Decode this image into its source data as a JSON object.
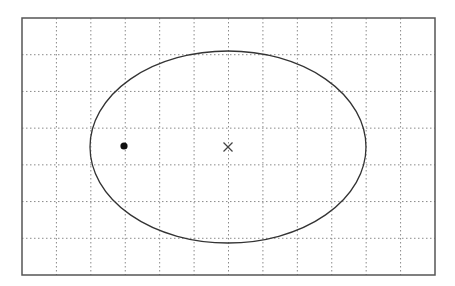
{
  "diagram": {
    "type": "ellipse-on-grid",
    "canvas": {
      "width": 455,
      "height": 286,
      "background": "#ffffff"
    },
    "frame": {
      "x": 22,
      "y": 18,
      "width": 413,
      "height": 257,
      "stroke": "#555555",
      "stroke_width": 1.5
    },
    "grid": {
      "columns": 12,
      "rows": 7,
      "stroke": "#8a8a8a",
      "dash": "1.5,2.5",
      "stroke_width": 1
    },
    "ellipse": {
      "cx": 228,
      "cy": 147,
      "rx": 138,
      "ry": 96,
      "stroke": "#333333",
      "stroke_width": 1.3,
      "fill": "none"
    },
    "center_marker": {
      "symbol": "cross",
      "x": 228,
      "y": 147,
      "size": 4.5,
      "stroke": "#444444"
    },
    "point": {
      "symbol": "dot",
      "x": 124,
      "y": 146,
      "r": 3.6,
      "fill": "#111111"
    }
  }
}
